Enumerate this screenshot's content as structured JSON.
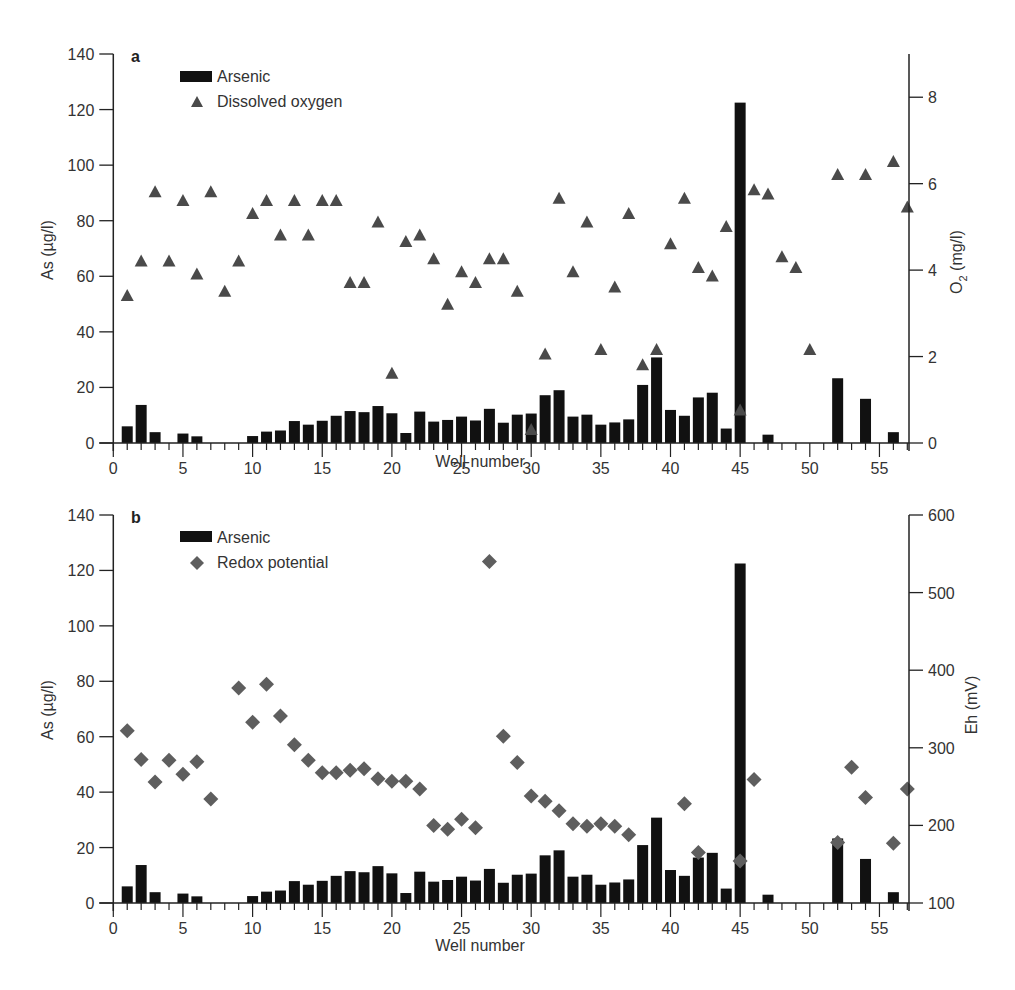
{
  "chart_data": [
    {
      "panel": "a",
      "type": "bar+scatter",
      "title": "",
      "panel_label": "a",
      "xlabel": "Well number",
      "ylabel": "As (µg/l)",
      "ylabel_right": "O2 (mg/l)",
      "xlim": [
        0,
        57
      ],
      "ylim": [
        0,
        140
      ],
      "ylim_right": [
        0,
        9
      ],
      "x_ticks": [
        0,
        5,
        10,
        15,
        20,
        25,
        30,
        35,
        40,
        45,
        50,
        55
      ],
      "y_ticks": [
        0,
        20,
        40,
        60,
        80,
        100,
        120,
        140
      ],
      "y_ticks_right": [
        0,
        2,
        4,
        6,
        8
      ],
      "grid": false,
      "legend": {
        "position": "upper-left",
        "entries": [
          "Arsenic",
          "Dissolved oxygen"
        ]
      },
      "series": [
        {
          "name": "Arsenic",
          "type": "bar",
          "axis": "left",
          "color": "#111111",
          "x": [
            1,
            2,
            3,
            5,
            6,
            10,
            11,
            12,
            13,
            14,
            15,
            16,
            17,
            18,
            19,
            20,
            21,
            22,
            23,
            24,
            25,
            26,
            27,
            28,
            29,
            30,
            31,
            32,
            33,
            34,
            35,
            36,
            37,
            38,
            39,
            40,
            41,
            42,
            43,
            44,
            45,
            47,
            52,
            54,
            56
          ],
          "values": [
            6,
            13.7,
            3.9,
            3.4,
            2.4,
            2.5,
            4.1,
            4.5,
            7.9,
            6.6,
            8.0,
            9.8,
            11.5,
            11.1,
            13.3,
            10.7,
            3.6,
            11.3,
            7.7,
            8.3,
            9.5,
            8.1,
            12.3,
            7.3,
            10.2,
            10.6,
            17.2,
            19.0,
            9.5,
            10.2,
            6.6,
            7.4,
            8.5,
            20.9,
            30.8,
            11.9,
            9.8,
            16.4,
            18.1,
            5.2,
            122.5,
            3.0,
            23.3,
            15.9,
            3.9
          ]
        },
        {
          "name": "Dissolved oxygen",
          "type": "scatter",
          "marker": "triangle",
          "axis": "right",
          "color": "#4a4a4a",
          "x": [
            1,
            2,
            3,
            4,
            5,
            6,
            7,
            8,
            9,
            10,
            11,
            12,
            13,
            14,
            15,
            16,
            17,
            18,
            19,
            20,
            21,
            22,
            23,
            24,
            25,
            26,
            27,
            28,
            29,
            30,
            31,
            32,
            33,
            34,
            35,
            36,
            37,
            38,
            39,
            40,
            41,
            42,
            43,
            44,
            45,
            46,
            47,
            48,
            49,
            50,
            52,
            54,
            56,
            57
          ],
          "values": [
            3.4,
            4.2,
            5.8,
            4.2,
            5.6,
            3.9,
            5.8,
            3.5,
            4.2,
            5.3,
            5.6,
            4.8,
            5.6,
            4.8,
            5.6,
            5.6,
            3.7,
            3.7,
            5.1,
            1.6,
            4.65,
            4.8,
            4.25,
            3.2,
            3.95,
            3.7,
            4.25,
            4.25,
            3.5,
            0.3,
            2.05,
            5.65,
            3.95,
            5.1,
            2.15,
            3.6,
            5.3,
            1.8,
            2.15,
            4.6,
            5.65,
            4.05,
            3.85,
            5.0,
            0.75,
            5.85,
            5.75,
            4.3,
            4.05,
            2.15,
            6.2,
            6.2,
            6.5,
            5.45
          ]
        }
      ]
    },
    {
      "panel": "b",
      "type": "bar+scatter",
      "title": "",
      "panel_label": "b",
      "xlabel": "Well number",
      "ylabel": "As (µg/l)",
      "ylabel_right": "Eh (mV)",
      "xlim": [
        0,
        57
      ],
      "ylim": [
        0,
        140
      ],
      "ylim_right": [
        100,
        600
      ],
      "x_ticks": [
        0,
        5,
        10,
        15,
        20,
        25,
        30,
        35,
        40,
        45,
        50,
        55
      ],
      "y_ticks": [
        0,
        20,
        40,
        60,
        80,
        100,
        120,
        140
      ],
      "y_ticks_right": [
        100,
        200,
        300,
        400,
        500,
        600
      ],
      "grid": false,
      "legend": {
        "position": "upper-left",
        "entries": [
          "Arsenic",
          "Redox potential"
        ]
      },
      "series": [
        {
          "name": "Arsenic",
          "type": "bar",
          "axis": "left",
          "color": "#111111",
          "x": [
            1,
            2,
            3,
            5,
            6,
            10,
            11,
            12,
            13,
            14,
            15,
            16,
            17,
            18,
            19,
            20,
            21,
            22,
            23,
            24,
            25,
            26,
            27,
            28,
            29,
            30,
            31,
            32,
            33,
            34,
            35,
            36,
            37,
            38,
            39,
            40,
            41,
            42,
            43,
            44,
            45,
            47,
            52,
            54,
            56
          ],
          "values": [
            6,
            13.7,
            3.9,
            3.4,
            2.4,
            2.5,
            4.1,
            4.5,
            7.9,
            6.6,
            8.0,
            9.8,
            11.5,
            11.1,
            13.3,
            10.7,
            3.6,
            11.3,
            7.7,
            8.3,
            9.5,
            8.1,
            12.3,
            7.3,
            10.2,
            10.6,
            17.2,
            19.0,
            9.5,
            10.2,
            6.6,
            7.4,
            8.5,
            20.9,
            30.8,
            11.9,
            9.8,
            16.4,
            18.1,
            5.2,
            122.5,
            3.0,
            23.3,
            15.9,
            3.9
          ]
        },
        {
          "name": "Redox potential",
          "type": "scatter",
          "marker": "diamond",
          "axis": "right",
          "color": "#5e5e5e",
          "x": [
            1,
            2,
            3,
            4,
            5,
            6,
            7,
            9,
            10,
            11,
            12,
            13,
            14,
            15,
            16,
            17,
            18,
            19,
            20,
            21,
            22,
            23,
            24,
            25,
            26,
            27,
            28,
            29,
            30,
            31,
            32,
            33,
            34,
            35,
            36,
            37,
            41,
            42,
            45,
            46,
            52,
            53,
            54,
            56,
            57
          ],
          "values": [
            322,
            285,
            256,
            284,
            266,
            282,
            234,
            377,
            333,
            382,
            341,
            304,
            284,
            268,
            268,
            271,
            273,
            260,
            257,
            257,
            247,
            200,
            195,
            208,
            197,
            540,
            315,
            281,
            238,
            231,
            219,
            202,
            199,
            202,
            199,
            188,
            228,
            165,
            154,
            259,
            178,
            275,
            236,
            177,
            247
          ]
        }
      ]
    }
  ],
  "panels": {
    "a": {
      "letter": "a",
      "legend_bar": "Arsenic",
      "legend_marker": "Dissolved oxygen",
      "xlabel": "Well number",
      "ylabel": "As (µg/l)",
      "ylabel_right_main": "O",
      "ylabel_right_sub": "2",
      "ylabel_right_rest": " (mg/l)"
    },
    "b": {
      "letter": "b",
      "legend_bar": "Arsenic",
      "legend_marker": "Redox potential",
      "xlabel": "Well number",
      "ylabel": "As (µg/l)",
      "ylabel_right": "Eh (mV)"
    }
  }
}
